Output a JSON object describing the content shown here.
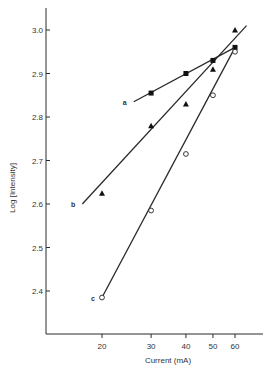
{
  "chart_data": {
    "type": "scatter",
    "title": "",
    "xlabel": "Current (mA)",
    "ylabel": "Log [Intensity]",
    "x_scale": "log",
    "x_ticks": [
      20,
      30,
      40,
      50,
      60
    ],
    "y_ticks": [
      2.4,
      2.5,
      2.6,
      2.7,
      2.8,
      2.9,
      3.0
    ],
    "y_tick_labels": [
      "2.4",
      "2.5",
      "2.6",
      "2.7",
      "2.8",
      "2.9",
      "3.0"
    ],
    "x_tick_labels": [
      "20",
      "30",
      "40",
      "50",
      "60"
    ],
    "ylim": [
      2.3,
      3.05
    ],
    "xlim": [
      14,
      70
    ],
    "grid": false,
    "legend": "inline line labels (a, b, c)",
    "series": [
      {
        "name": "a",
        "marker": "filled-square",
        "x": [
          30,
          40,
          50,
          60
        ],
        "values": [
          2.855,
          2.9,
          2.93,
          2.96
        ],
        "fit_line": {
          "x_start": 26,
          "y_start": 2.835,
          "x_end": 60,
          "y_end": 2.96
        }
      },
      {
        "name": "b",
        "marker": "filled-triangle",
        "x": [
          20,
          30,
          40,
          50,
          60
        ],
        "values": [
          2.625,
          2.78,
          2.83,
          2.91,
          3.0
        ],
        "fit_line": {
          "x_start": 17,
          "y_start": 2.6,
          "x_end": 66,
          "y_end": 3.01
        }
      },
      {
        "name": "c",
        "marker": "open-circle",
        "x": [
          20,
          30,
          40,
          50,
          60
        ],
        "values": [
          2.385,
          2.585,
          2.715,
          2.85,
          2.95
        ],
        "fit_line": {
          "x_start": 20,
          "y_start": 2.385,
          "x_end": 60,
          "y_end": 2.96
        }
      }
    ]
  }
}
